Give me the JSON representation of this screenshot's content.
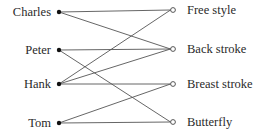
{
  "diagram": {
    "type": "bipartite-graph",
    "left_nodes": [
      {
        "id": "charles",
        "label": "Charles",
        "x": 59,
        "y": 12
      },
      {
        "id": "peter",
        "label": "Peter",
        "x": 59,
        "y": 50
      },
      {
        "id": "hank",
        "label": "Hank",
        "x": 59,
        "y": 84
      },
      {
        "id": "tom",
        "label": "Tom",
        "x": 59,
        "y": 123
      }
    ],
    "right_nodes": [
      {
        "id": "free_style",
        "label": "Free style",
        "x": 173,
        "y": 10
      },
      {
        "id": "back_stroke",
        "label": "Back stroke",
        "x": 173,
        "y": 49
      },
      {
        "id": "breast_stroke",
        "label": "Breast stroke",
        "x": 173,
        "y": 84
      },
      {
        "id": "butterfly",
        "label": "Butterfly",
        "x": 173,
        "y": 122
      }
    ],
    "edges": [
      [
        "charles",
        "free_style"
      ],
      [
        "charles",
        "back_stroke"
      ],
      [
        "peter",
        "back_stroke"
      ],
      [
        "peter",
        "butterfly"
      ],
      [
        "hank",
        "free_style"
      ],
      [
        "hank",
        "back_stroke"
      ],
      [
        "hank",
        "breast_stroke"
      ],
      [
        "tom",
        "breast_stroke"
      ],
      [
        "tom",
        "butterfly"
      ]
    ]
  }
}
